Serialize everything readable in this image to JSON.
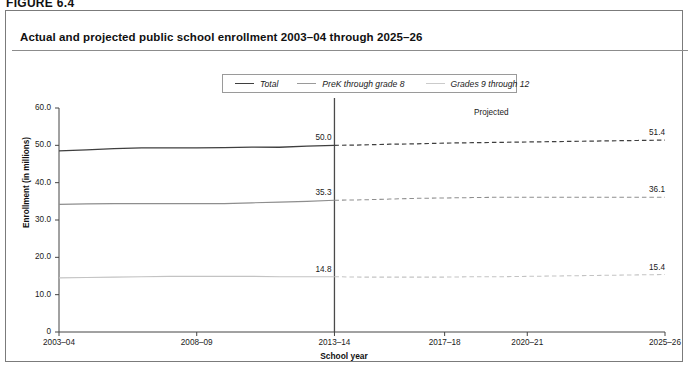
{
  "figure_label": "FIGURE 6.4",
  "panel_title": "Actual and projected public school enrollment 2003–04 through 2025–26",
  "legend": {
    "items": [
      {
        "label": "Total",
        "color": "#3f3f3f"
      },
      {
        "label": "PreK through grade 8",
        "color": "#8e8e8e"
      },
      {
        "label": "Grades 9 through 12",
        "color": "#c3c3c3"
      }
    ]
  },
  "annotations": {
    "projected": "Projected"
  },
  "chart_data": {
    "type": "line",
    "title": "Actual and projected public school enrollment 2003–04 through 2025–26",
    "xlabel": "School year",
    "ylabel": "Enrollment (in millions)",
    "ylim": [
      0,
      60
    ],
    "yticks": [
      "0",
      "10.0",
      "20.0",
      "30.0",
      "40.0",
      "50.0",
      "60.0"
    ],
    "ytick_values": [
      0,
      10,
      20,
      30,
      40,
      50,
      60
    ],
    "xticks": [
      "2003–04",
      "2008–09",
      "2013–14",
      "2017–18",
      "2020–21",
      "2025–26"
    ],
    "xtick_values": [
      2003,
      2008,
      2013,
      2017,
      2020,
      2025
    ],
    "xlim": [
      2003,
      2025
    ],
    "grid": false,
    "legend_position": "top-center",
    "projection_split_x": 2013,
    "projection_note": "Values to the right of the 2013–14 divider are projected and drawn with dashed lines.",
    "series": [
      {
        "name": "Total",
        "color": "#3f3f3f",
        "x": [
          2003,
          2004,
          2005,
          2006,
          2007,
          2008,
          2009,
          2010,
          2011,
          2012,
          2013,
          2014,
          2015,
          2016,
          2017,
          2018,
          2019,
          2020,
          2021,
          2022,
          2023,
          2024,
          2025
        ],
        "values": [
          48.5,
          48.8,
          49.1,
          49.3,
          49.3,
          49.3,
          49.4,
          49.5,
          49.5,
          49.8,
          50.0,
          50.1,
          50.3,
          50.4,
          50.6,
          50.7,
          50.8,
          50.9,
          51.0,
          51.1,
          51.2,
          51.3,
          51.4
        ],
        "label_at_split": "50.0",
        "label_at_end": "51.4"
      },
      {
        "name": "PreK through grade 8",
        "color": "#8e8e8e",
        "x": [
          2003,
          2004,
          2005,
          2006,
          2007,
          2008,
          2009,
          2010,
          2011,
          2012,
          2013,
          2014,
          2015,
          2016,
          2017,
          2018,
          2019,
          2020,
          2021,
          2022,
          2023,
          2024,
          2025
        ],
        "values": [
          34.2,
          34.3,
          34.4,
          34.4,
          34.4,
          34.4,
          34.4,
          34.6,
          34.8,
          35.0,
          35.3,
          35.4,
          35.6,
          35.8,
          35.9,
          36.0,
          36.1,
          36.1,
          36.1,
          36.1,
          36.1,
          36.1,
          36.1
        ],
        "label_at_split": "35.3",
        "label_at_end": "36.1"
      },
      {
        "name": "Grades 9 through 12",
        "color": "#c3c3c3",
        "x": [
          2003,
          2004,
          2005,
          2006,
          2007,
          2008,
          2009,
          2010,
          2011,
          2012,
          2013,
          2014,
          2015,
          2016,
          2017,
          2018,
          2019,
          2020,
          2021,
          2022,
          2023,
          2024,
          2025
        ],
        "values": [
          14.5,
          14.6,
          14.7,
          14.8,
          14.9,
          14.9,
          14.9,
          14.9,
          14.8,
          14.8,
          14.8,
          14.7,
          14.7,
          14.7,
          14.7,
          14.8,
          14.8,
          14.9,
          15.0,
          15.1,
          15.2,
          15.3,
          15.4
        ],
        "label_at_split": "14.8",
        "label_at_end": "15.4"
      }
    ]
  }
}
